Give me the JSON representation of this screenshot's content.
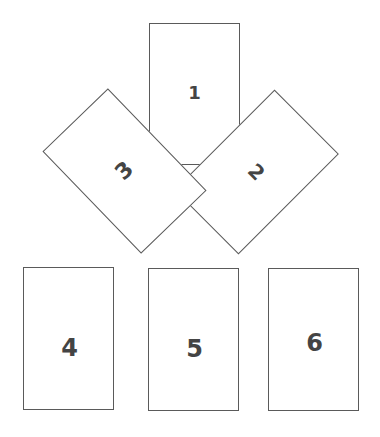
{
  "diagram": {
    "type": "card-layout",
    "border_color": "#5a5a5a",
    "number_color": "#444444",
    "background": "#ffffff",
    "cards": [
      {
        "id": 1,
        "label": "1",
        "rotation_deg": 0
      },
      {
        "id": 2,
        "label": "2",
        "rotation_deg": 45
      },
      {
        "id": 3,
        "label": "3",
        "rotation_deg": -44
      },
      {
        "id": 4,
        "label": "4",
        "rotation_deg": 0
      },
      {
        "id": 5,
        "label": "5",
        "rotation_deg": 0
      },
      {
        "id": 6,
        "label": "6",
        "rotation_deg": 0
      }
    ]
  }
}
